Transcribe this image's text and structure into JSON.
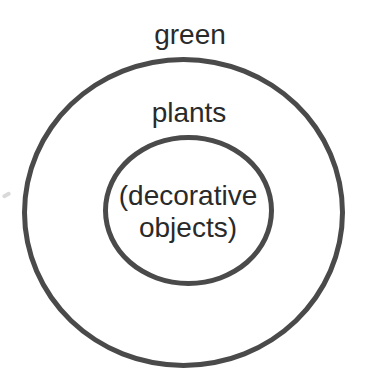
{
  "diagram": {
    "type": "concentric-circles",
    "outer_label": "green",
    "middle_label": "plants",
    "inner_label": "(decorative objects)",
    "hierarchy": [
      "green",
      "plants",
      "(decorative objects)"
    ],
    "colors": {
      "stroke": "#4a4a4a",
      "text": "#2a2a2a",
      "background": "#ffffff"
    }
  }
}
